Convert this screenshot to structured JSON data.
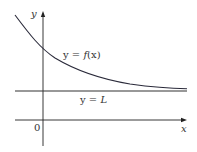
{
  "figure": {
    "colors": {
      "axis": "#222222",
      "curve": "#2a2a3a",
      "asymptote": "#333333",
      "text": "#333333",
      "background": "#ffffff"
    }
  },
  "axes": {
    "x_label": "x",
    "y_label": "y",
    "origin_label": "0"
  },
  "curve": {
    "label": "y = f(x)",
    "label_parts": {
      "lhs": "y",
      "eq": " = ",
      "fn": "f",
      "arg": "(x)"
    },
    "type": "decreasing curve approaching asymptote from above"
  },
  "asymptote": {
    "label": "y = L",
    "label_parts": {
      "lhs": "y",
      "eq": " = ",
      "rhs": "L"
    },
    "orientation": "horizontal"
  }
}
